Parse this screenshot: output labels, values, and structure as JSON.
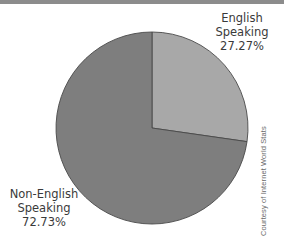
{
  "chart_data": {
    "type": "pie",
    "title": "",
    "categories": [
      "English Speaking",
      "Non-English Speaking"
    ],
    "values": [
      27.27,
      72.73
    ],
    "value_labels": [
      "27.27%",
      "72.73%"
    ],
    "unit": "%",
    "start_angle": "12 o'clock",
    "direction": "clockwise",
    "colors": [
      "#a8a8a8",
      "#7e7e7e"
    ],
    "legend": "none (direct labels)",
    "annotations": [
      "Courtesy of Internet World Stats"
    ]
  },
  "labels": {
    "english": {
      "line1": "English",
      "line2": "Speaking",
      "value": "27.27%"
    },
    "non_english": {
      "line1": "Non-English",
      "line2": "Speaking",
      "value": "72.73%"
    }
  },
  "credit": "Courtesy of Internet World Stats",
  "colors": {
    "english_slice": "#a8a8a8",
    "non_english_slice": "#7e7e7e",
    "slice_border": "#4a4a4a",
    "top_rule": "#8c8c8c",
    "text": "#3a3a3a"
  }
}
